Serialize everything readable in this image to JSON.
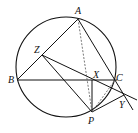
{
  "diagram": {
    "type": "geometry",
    "circle": {
      "cx": 66,
      "cy": 67,
      "r": 50
    },
    "points": {
      "A": {
        "x": 78,
        "y": 19
      },
      "B": {
        "x": 17,
        "y": 80
      },
      "C": {
        "x": 115,
        "y": 79
      },
      "Z": {
        "x": 42,
        "y": 55
      },
      "X": {
        "x": 92,
        "y": 79
      },
      "P": {
        "x": 92,
        "y": 112
      },
      "Y": {
        "x": 123,
        "y": 95
      }
    },
    "labels": {
      "A": "A",
      "B": "B",
      "C": "C",
      "Z": "Z",
      "X": "X",
      "P": "P",
      "Y": "Y"
    },
    "segments": [
      {
        "from": "A",
        "to": "B",
        "style": "solid"
      },
      {
        "from": "A",
        "to": "C",
        "style": "solid",
        "extended": true
      },
      {
        "from": "B",
        "to": "C",
        "style": "solid"
      },
      {
        "from": "Z",
        "to": "P",
        "style": "solid"
      },
      {
        "from": "Z",
        "to": "Y",
        "style": "solid",
        "extended": true
      },
      {
        "from": "X",
        "to": "P",
        "style": "solid"
      },
      {
        "from": "P",
        "to": "Y",
        "style": "solid"
      },
      {
        "from": "A",
        "to": "P",
        "style": "dashed"
      },
      {
        "from": "P",
        "to": "C",
        "style": "dashed"
      }
    ]
  }
}
